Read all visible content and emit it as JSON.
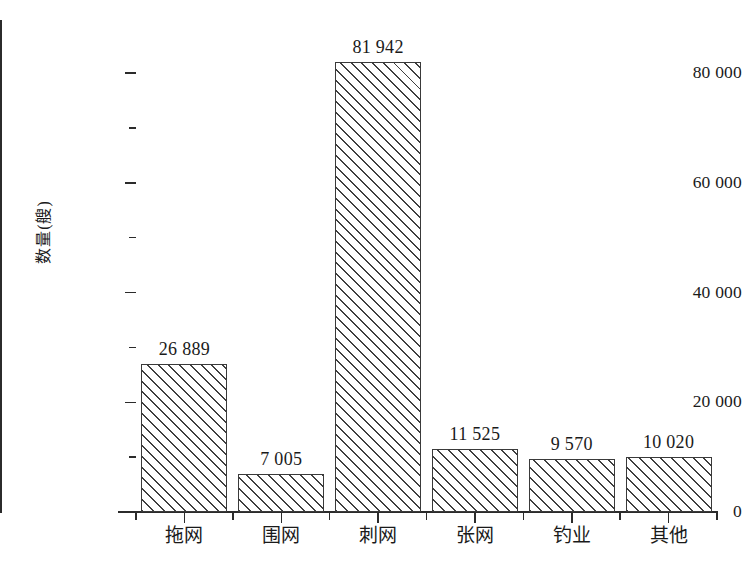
{
  "chart_data": {
    "type": "bar",
    "title": "",
    "subtitle": "",
    "xlabel": "",
    "ylabel": "数量(艘)",
    "categories": [
      "拖网",
      "围网",
      "刺网",
      "张网",
      "钓业",
      "其他"
    ],
    "values": [
      26889,
      7005,
      81942,
      11525,
      9570,
      10020
    ],
    "value_labels": [
      "26 889",
      "7 005",
      "81 942",
      "11 525",
      "9 570",
      "10 020"
    ],
    "ylim": [
      0,
      88000
    ],
    "ytick_major_values": [
      0,
      20000,
      40000,
      60000,
      80000
    ],
    "ytick_major_labels": [
      "0",
      "20 000",
      "40 000",
      "60 000",
      "80 000"
    ],
    "ytick_minor_values": [
      10000,
      30000,
      50000,
      70000
    ],
    "grid": false,
    "legend": false,
    "bar_fill": "diagonal-hatch",
    "bar_edge_color": "#3a3a3a",
    "bar_hatch_color": "#3f3f3f",
    "background_color": "#ffffff",
    "axis_color": "#2b2b2b"
  },
  "axis": {
    "y_title": "数量(艘)",
    "tick_labels_y": [
      "80 000",
      "60 000",
      "40 000",
      "20 000",
      "0"
    ],
    "tick_labels_x": [
      "拖网",
      "围网",
      "刺网",
      "张网",
      "钓业",
      "其他"
    ]
  },
  "bars": [
    {
      "category": "拖网",
      "value": 26889,
      "label": "26 889"
    },
    {
      "category": "围网",
      "value": 7005,
      "label": "7 005"
    },
    {
      "category": "刺网",
      "value": 81942,
      "label": "81 942"
    },
    {
      "category": "张网",
      "value": 11525,
      "label": "11 525"
    },
    {
      "category": "钓业",
      "value": 9570,
      "label": "9 570"
    },
    {
      "category": "其他",
      "value": 10020,
      "label": "10 020"
    }
  ]
}
